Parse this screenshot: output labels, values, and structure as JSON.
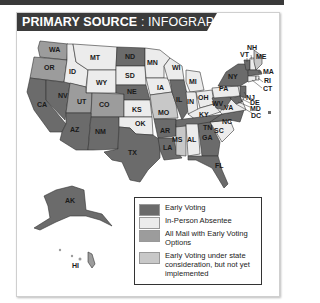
{
  "header": {
    "title_bold": "PRIMARY SOURCE",
    "separator": " : ",
    "title_light": "INFOGRAPHIC"
  },
  "colors": {
    "early_voting": "#6b6b6b",
    "in_person_absentee": "#ececec",
    "all_mail": "#9c9c9c",
    "under_consideration": "#c8c8c8",
    "header_bg": "#3b3b3b"
  },
  "legend": {
    "items": [
      {
        "key": "early_voting",
        "label": "Early Voting"
      },
      {
        "key": "in_person_absentee",
        "label": "In-Person Absentee"
      },
      {
        "key": "all_mail",
        "label": "All Mail with Early Voting Options"
      },
      {
        "key": "under_consideration",
        "label": "Early Voting under state consideration, but not yet implemented"
      }
    ]
  },
  "map": {
    "states": {
      "WA": "all_mail",
      "OR": "all_mail",
      "CA": "early_voting",
      "NV": "early_voting",
      "ID": "in_person_absentee",
      "MT": "in_person_absentee",
      "WY": "in_person_absentee",
      "UT": "all_mail",
      "CO": "all_mail",
      "AZ": "early_voting",
      "NM": "early_voting",
      "ND": "early_voting",
      "SD": "in_person_absentee",
      "NE": "early_voting",
      "KS": "in_person_absentee",
      "OK": "in_person_absentee",
      "TX": "early_voting",
      "MN": "in_person_absentee",
      "IA": "in_person_absentee",
      "MO": "under_consideration",
      "AR": "early_voting",
      "LA": "early_voting",
      "WI": "in_person_absentee",
      "IL": "early_voting",
      "MS": "under_consideration",
      "MI": "in_person_absentee",
      "IN": "in_person_absentee",
      "OH": "in_person_absentee",
      "KY": "in_person_absentee",
      "TN": "early_voting",
      "AL": "in_person_absentee",
      "GA": "early_voting",
      "FL": "early_voting",
      "SC": "in_person_absentee",
      "NC": "early_voting",
      "VA": "in_person_absentee",
      "WV": "early_voting",
      "PA": "in_person_absentee",
      "NY": "early_voting",
      "VT": "early_voting",
      "NH": "in_person_absentee",
      "ME": "under_consideration",
      "MA": "early_voting",
      "RI": "in_person_absentee",
      "CT": "in_person_absentee",
      "NJ": "early_voting",
      "DE": "in_person_absentee",
      "MD": "early_voting",
      "DC": "early_voting",
      "AK": "early_voting",
      "HI": "all_mail"
    }
  }
}
